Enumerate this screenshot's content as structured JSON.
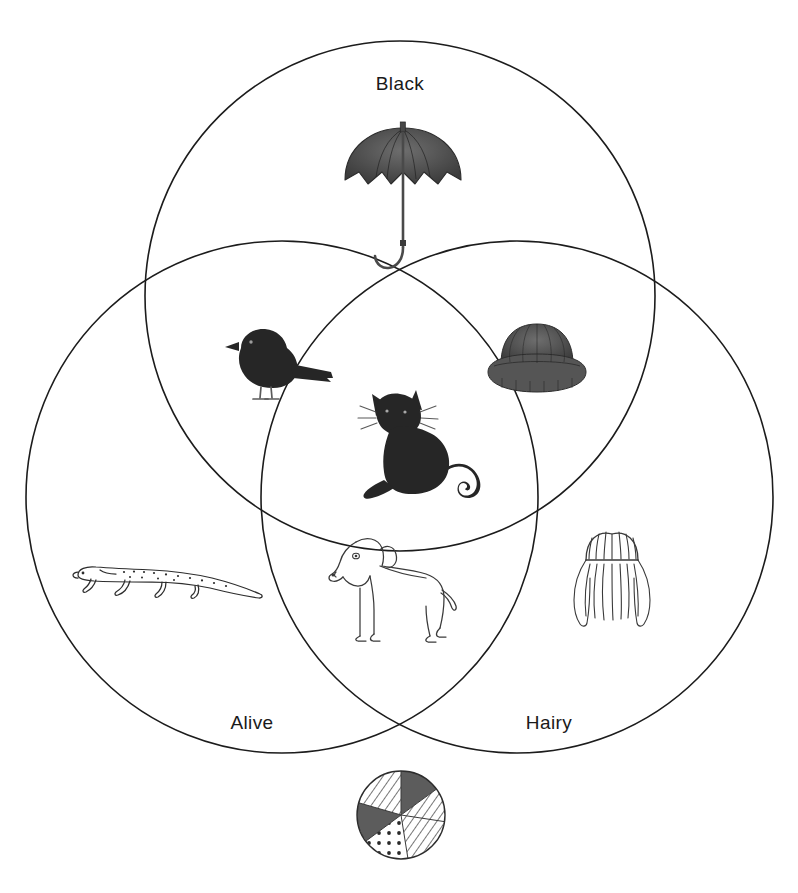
{
  "diagram": {
    "type": "venn-3-set",
    "title": "",
    "background_color": "#ffffff",
    "stroke_color": "#1c1c1c",
    "sets": [
      {
        "id": "black",
        "label": "Black",
        "position": "top",
        "center_x": 400,
        "center_y": 296,
        "radius": 255,
        "label_x": 400,
        "label_y": 90
      },
      {
        "id": "alive",
        "label": "Alive",
        "position": "bottom-left",
        "center_x": 282,
        "center_y": 497,
        "radius": 256,
        "label_x": 252,
        "label_y": 729
      },
      {
        "id": "hairy",
        "label": "Hairy",
        "position": "bottom-right",
        "center_x": 517,
        "center_y": 497,
        "radius": 256,
        "label_x": 549,
        "label_y": 729
      }
    ],
    "items": [
      {
        "id": "umbrella",
        "name": "umbrella",
        "icon": "umbrella-icon",
        "region": "black-only",
        "sets": [
          "black"
        ],
        "style": "filled-dark",
        "x": 341,
        "y": 122,
        "width": 124,
        "height": 160
      },
      {
        "id": "blackbird",
        "name": "blackbird",
        "icon": "bird-icon",
        "region": "black-and-alive",
        "sets": [
          "black",
          "alive"
        ],
        "style": "filled-dark",
        "x": 215,
        "y": 320,
        "width": 124,
        "height": 86
      },
      {
        "id": "furry-hat",
        "name": "furry hat",
        "icon": "hat-icon",
        "region": "black-and-hairy",
        "sets": [
          "black",
          "hairy"
        ],
        "style": "filled-dark",
        "x": 482,
        "y": 316,
        "width": 110,
        "height": 82
      },
      {
        "id": "black-cat",
        "name": "black cat",
        "icon": "cat-icon",
        "region": "all-three",
        "sets": [
          "black",
          "alive",
          "hairy"
        ],
        "style": "filled-dark",
        "x": 350,
        "y": 388,
        "width": 138,
        "height": 120
      },
      {
        "id": "lizard",
        "name": "lizard",
        "icon": "lizard-icon",
        "region": "alive-only",
        "sets": [
          "alive"
        ],
        "style": "outline",
        "x": 70,
        "y": 556,
        "width": 196,
        "height": 56
      },
      {
        "id": "dog",
        "name": "dog",
        "icon": "dog-icon",
        "region": "alive-and-hairy",
        "sets": [
          "alive",
          "hairy"
        ],
        "style": "outline",
        "x": 322,
        "y": 528,
        "width": 140,
        "height": 118
      },
      {
        "id": "wig",
        "name": "wig",
        "icon": "wig-icon",
        "region": "hairy-only",
        "sets": [
          "hairy"
        ],
        "style": "outline",
        "x": 556,
        "y": 524,
        "width": 112,
        "height": 108
      },
      {
        "id": "beach-ball",
        "name": "beach ball",
        "icon": "ball-icon",
        "region": "outside-all",
        "sets": [],
        "style": "patterned",
        "x": 354,
        "y": 768,
        "width": 94,
        "height": 94
      }
    ]
  }
}
